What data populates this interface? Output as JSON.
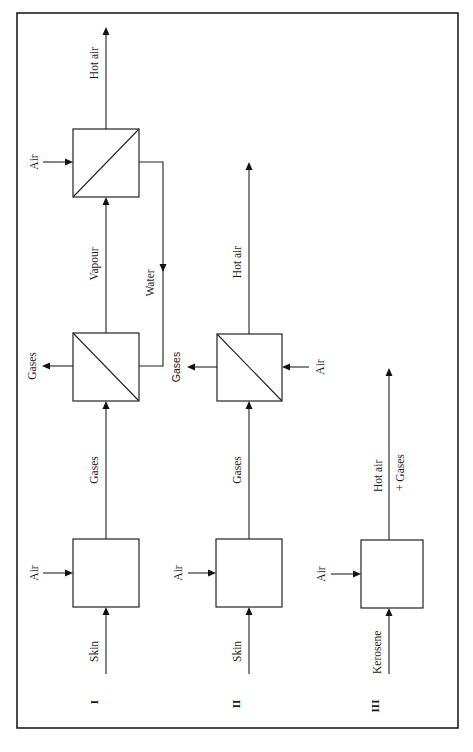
{
  "diagram": {
    "orientation": "rotated 90 degrees counter-clockwise",
    "processes": [
      {
        "id": "I",
        "numeral": "I",
        "input_label": "Skin",
        "stages": [
          {
            "name": "combustion-chamber",
            "air_label": "Air",
            "output_label": "Gases"
          },
          {
            "name": "heat-exchanger-1",
            "side_output_label": "Gases",
            "output_label": "Vapour",
            "return_input_label": "Water"
          },
          {
            "name": "heat-exchanger-2",
            "air_label": "Air",
            "output_label": "Hot air"
          }
        ]
      },
      {
        "id": "II",
        "numeral": "II",
        "input_label": "Skin",
        "stages": [
          {
            "name": "combustion-chamber",
            "air_label": "Air",
            "output_label": "Gases"
          },
          {
            "name": "heat-exchanger",
            "side_output_label": "Gases",
            "air_label": "Air",
            "output_label": "Hot air"
          }
        ]
      },
      {
        "id": "III",
        "numeral": "III",
        "input_label": "Kerosene",
        "stages": [
          {
            "name": "combustion-chamber",
            "air_label": "Air",
            "output_label_line1": "Hot air",
            "output_label_line2": "+ Gases"
          }
        ]
      }
    ],
    "colors": {
      "line": "#222222",
      "background": "#ffffff"
    }
  }
}
